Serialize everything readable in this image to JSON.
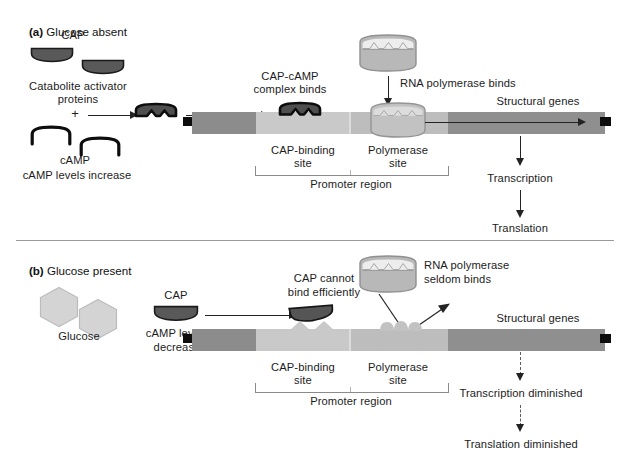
{
  "figure": {
    "type": "diagram"
  },
  "panel_a": {
    "marker": "(a)",
    "title": "Glucose absent",
    "cap_label": "CAP",
    "catabolite_label_line1": "Catabolite activator",
    "catabolite_label_line2": "proteins",
    "plus_sign": "+",
    "camp_label": "cAMP",
    "camp_status": "cAMP levels increase",
    "complex_label_line1": "CAP-cAMP",
    "complex_label_line2": "complex binds",
    "polymerase_binds_label": "RNA polymerase binds",
    "structural_genes_label": "Structural genes",
    "cap_binding_site_line1": "CAP-binding",
    "cap_binding_site_line2": "site",
    "polymerase_site_line1": "Polymerase",
    "polymerase_site_line2": "site",
    "promoter_region_label": "Promoter region",
    "transcription_label": "Transcription",
    "translation_label": "Translation"
  },
  "panel_b": {
    "marker": "(b)",
    "title": "Glucose present",
    "glucose_label": "Glucose",
    "cap_label": "CAP",
    "camp_status_line1": "cAMP levels",
    "camp_status_line2": "decrease",
    "cap_cannot_line1": "CAP cannot",
    "cap_cannot_line2": "bind efficiently",
    "polymerase_seldom_line1": "RNA polymerase",
    "polymerase_seldom_line2": "seldom binds",
    "structural_genes_label": "Structural genes",
    "cap_binding_site_line1": "CAP-binding",
    "cap_binding_site_line2": "site",
    "polymerase_site_line1": "Polymerase",
    "polymerase_site_line2": "site",
    "promoter_region_label": "Promoter region",
    "transcription_label": "Transcription diminished",
    "translation_label": "Translation diminished"
  },
  "colors": {
    "cap_protein": "#595959",
    "cap_outline": "#111111",
    "camp_outline": "#0d0d0d",
    "polymerase_fill": "#b8b8b8",
    "polymerase_outline": "#8e8e8e",
    "glucose_fill": "#d2d2d2",
    "glucose_outline": "#b4b4b4",
    "dna_dark": "#8c8c8c",
    "dna_light": "#c9c9c9",
    "dna_gene": "#8f8f8f",
    "dna_tip": "#0d0d0d",
    "text": "#1c1c1c",
    "arrow": "#232323",
    "bracket": "#8a8a8a"
  },
  "icons": {
    "cap_protein": "cap-protein-dome-icon",
    "camp": "camp-arch-icon",
    "cap_camp_complex": "cap-camp-complex-icon",
    "rna_polymerase": "rna-polymerase-barrel-icon",
    "glucose": "glucose-hexagon-icon",
    "arrow_right": "arrow-right-icon",
    "arrow_down": "arrow-down-icon",
    "arrow_down_dashed": "arrow-down-dashed-icon"
  }
}
